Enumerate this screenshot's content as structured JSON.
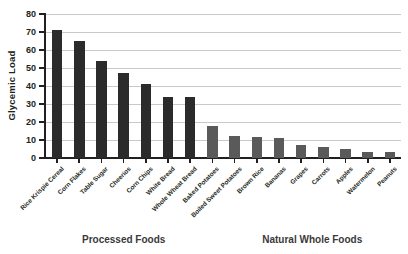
{
  "chart_data": {
    "type": "bar",
    "title": "",
    "subtitle": "",
    "xlabel": "",
    "ylabel": "Glycemic Load",
    "ylim": [
      0,
      80
    ],
    "yticks": [
      0,
      10,
      20,
      30,
      40,
      50,
      60,
      70,
      80
    ],
    "grid": true,
    "legend": false,
    "categories": [
      "Rice Krispie Cereal",
      "Corn Flakes",
      "Table Sugar",
      "Cheerios",
      "Corn Chips",
      "White Bread",
      "Whole Wheat Bread",
      "Baked Potatoes",
      "Boiled Sweet Potatoes",
      "Brown Rice",
      "Bananas",
      "Grapes",
      "Carrots",
      "Apples",
      "Watermelon",
      "Peanuts"
    ],
    "values": [
      71,
      65,
      54,
      47,
      41,
      34,
      34,
      18,
      12,
      11.5,
      11,
      7,
      6,
      5,
      3.5,
      3.5
    ],
    "bar_colors": [
      "#2b2b2b",
      "#2b2b2b",
      "#2b2b2b",
      "#2b2b2b",
      "#2b2b2b",
      "#2b2b2b",
      "#2b2b2b",
      "#5a5a5a",
      "#5a5a5a",
      "#5a5a5a",
      "#5a5a5a",
      "#5a5a5a",
      "#5a5a5a",
      "#5a5a5a",
      "#5a5a5a",
      "#5a5a5a"
    ],
    "groups": [
      {
        "label": "Processed Foods",
        "start_index": 0,
        "end_index": 6
      },
      {
        "label": "Natural Whole Foods",
        "start_index": 8,
        "end_index": 15
      }
    ],
    "colors": {
      "processed": "#2b2b2b",
      "natural": "#5a5a5a",
      "grid": "#c9c9c9",
      "axis": "#231f20",
      "background": "#ffffff"
    }
  }
}
